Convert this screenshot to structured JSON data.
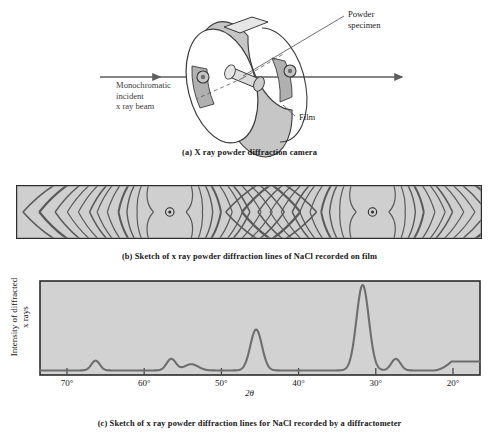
{
  "figure": {
    "title_implicit": "X ray powder diffraction",
    "colors": {
      "film_fill": "#cfcfcf",
      "ring_fill": "#c8c8c8",
      "plot_bg": "#d2d2d2",
      "line": "#6e6e6e",
      "frame": "#2b2b2b",
      "arc": "#5a5a5a",
      "label_gray": "#3b3b3b"
    }
  },
  "panel_a": {
    "caption": "(a)  X ray powder diffraction camera",
    "labels": {
      "beam_line1": "Monochromatic",
      "beam_line2": "incident",
      "beam_line3": "x ray beam",
      "specimen_line1": "Powder",
      "specimen_line2": "specimen",
      "film": "Film"
    }
  },
  "panel_b": {
    "caption": "(b)  Sketch of x ray powder diffraction lines of NaCl  recorded on film",
    "hole_centers_pct": [
      33.0,
      76.5
    ],
    "arc_offsets_pct": [
      3.5,
      7.0,
      9.2,
      11.0,
      13.4,
      15.6,
      17.2,
      19.6,
      22.0,
      24.6,
      28.0,
      31.5
    ],
    "arc_weights": [
      1.2,
      1.2,
      1.4,
      2.0,
      1.2,
      1.2,
      1.6,
      1.2,
      1.2,
      1.4,
      2.2,
      1.6
    ]
  },
  "panel_c": {
    "caption": "(c)  Sketch of x ray powder diffraction lines for NaCl recorded by a diffractometer"
  },
  "chart_data": {
    "type": "line",
    "title": "",
    "xlabel": "2θ",
    "ylabel_line1": "Intensity of diffracted",
    "ylabel_line2": "x rays",
    "xlim": [
      73.5,
      16.5
    ],
    "x_reversed": true,
    "ylim": [
      0,
      100
    ],
    "grid": false,
    "legend": false,
    "tick_labels": [
      "70°",
      "60°",
      "50°",
      "40°",
      "30°",
      "20°"
    ],
    "tick_values": [
      70,
      60,
      50,
      40,
      30,
      20
    ],
    "baseline": 4,
    "peaks": [
      {
        "two_theta": 66.3,
        "intensity": 11,
        "width": 0.55
      },
      {
        "two_theta": 56.5,
        "intensity": 13,
        "width": 0.6
      },
      {
        "two_theta": 53.9,
        "intensity": 7,
        "width": 0.9
      },
      {
        "two_theta": 45.5,
        "intensity": 46,
        "width": 0.75
      },
      {
        "two_theta": 31.7,
        "intensity": 96,
        "width": 0.8
      },
      {
        "two_theta": 27.4,
        "intensity": 13,
        "width": 0.6
      }
    ],
    "tail_rise": {
      "from_two_theta": 22.5,
      "to_two_theta": 20.2,
      "intensity": 14
    },
    "axis_ticks_direction": "up"
  }
}
